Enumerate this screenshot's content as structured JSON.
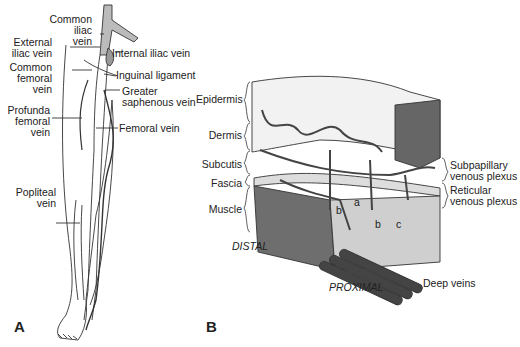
{
  "figure": {
    "panels": [
      {
        "id": "A",
        "label": "A",
        "subject": "Leg venous anatomy"
      },
      {
        "id": "B",
        "label": "B",
        "subject": "Skin layers and venous plexuses"
      }
    ]
  },
  "panel_a": {
    "label": "A",
    "labels": {
      "common_iliac": [
        "Common",
        "iliac",
        "vein"
      ],
      "external_iliac": [
        "External",
        "iliac vein"
      ],
      "internal_iliac": "Internal iliac vein",
      "common_femoral": [
        "Common",
        "femoral",
        "vein"
      ],
      "inguinal": "Inguinal ligament",
      "greater_saphenous": [
        "Greater",
        "saphenous vein"
      ],
      "profunda_femoral": [
        "Profunda",
        "femoral",
        "vein"
      ],
      "femoral": "Femoral vein",
      "popliteal": [
        "Popliteal",
        "vein"
      ]
    }
  },
  "panel_b": {
    "label": "B",
    "layers": [
      "Epidermis",
      "Dermis",
      "Subcutis",
      "Fascia",
      "Muscle"
    ],
    "plexuses": {
      "subpapillary": [
        "Subpapillary",
        "venous plexus"
      ],
      "reticular": [
        "Reticular",
        "venous plexus"
      ]
    },
    "markers": {
      "a": "a",
      "b1": "b",
      "b2": "b",
      "c": "c"
    },
    "directions": {
      "distal": "DISTAL",
      "proximal": "PROXIMAL"
    },
    "deep_veins": "Deep veins"
  },
  "colors": {
    "ink": "#222222",
    "shade": "#8a8a8a",
    "dark": "#555555"
  }
}
